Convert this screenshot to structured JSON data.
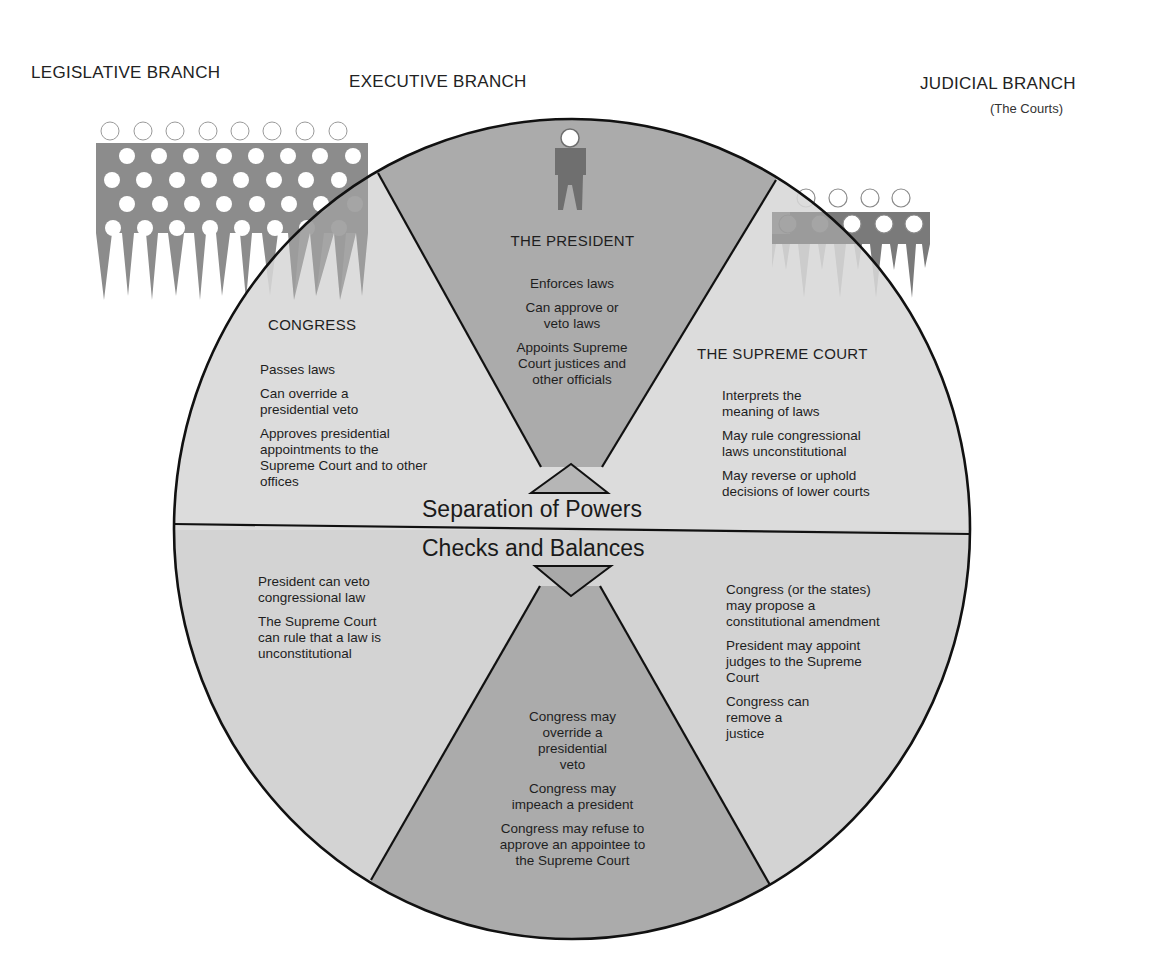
{
  "branches": {
    "legislative": {
      "title": "LEGISLATIVE BRANCH"
    },
    "executive": {
      "title": "EXECUTIVE BRANCH"
    },
    "judicial": {
      "title": "JUDICIAL BRANCH",
      "subtitle": "(The Courts)"
    }
  },
  "separation": {
    "label": "Separation of Powers",
    "congress": {
      "title": "CONGRESS",
      "items": [
        "Passes laws",
        "Can override a presidential veto",
        "Approves presidential appointments to the Supreme Court and to other offices"
      ]
    },
    "president": {
      "title": "THE PRESIDENT",
      "items": [
        "Enforces laws",
        "Can approve or veto laws",
        "Appoints Supreme Court justices and other officials"
      ]
    },
    "court": {
      "title": "THE SUPREME COURT",
      "items": [
        "Interprets the meaning of laws",
        "May rule congressional laws unconstitutional",
        "May reverse or uphold decisions of lower courts"
      ]
    }
  },
  "checks": {
    "label": "Checks and Balances",
    "on_congress": [
      "President can veto congressional law",
      "The Supreme Court can rule that a law is unconstitutional"
    ],
    "on_president": [
      "Congress may override a presidential veto",
      "Congress may impeach a president",
      "Congress may refuse to approve an appointee to the Supreme Court"
    ],
    "on_court": [
      "Congress (or the states) may propose a constitutional amendment",
      "President may appoint judges to the Supreme Court",
      "Congress can remove a justice"
    ]
  },
  "colors": {
    "light_sector": "#d7d7d7",
    "dark_sector": "#ababab",
    "figure_gray": "#8c8c8c",
    "figure_dark": "#6f6f6f",
    "outline": "#111111"
  }
}
